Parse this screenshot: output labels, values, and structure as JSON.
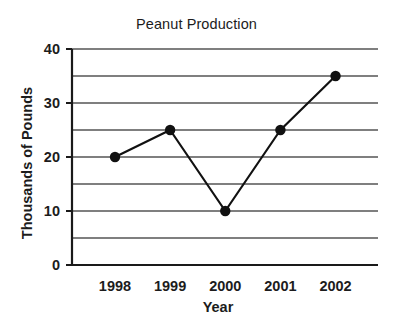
{
  "chart_data": {
    "type": "line",
    "title": "Peanut Production",
    "xlabel": "Year",
    "ylabel": "Thousands of Pounds",
    "categories": [
      "1998",
      "1999",
      "2000",
      "2001",
      "2002"
    ],
    "values": [
      20,
      25,
      10,
      25,
      35
    ],
    "series": [
      {
        "name": "Peanut Production",
        "values": [
          20,
          25,
          10,
          25,
          35
        ]
      }
    ],
    "ylim": [
      0,
      40
    ],
    "y_tick_labels": [
      "0",
      "10",
      "20",
      "30",
      "40"
    ],
    "y_tick_values": [
      0,
      10,
      20,
      30,
      40
    ],
    "gridline_values": [
      5,
      10,
      15,
      20,
      25,
      30,
      35,
      40
    ],
    "grid": true,
    "grid_orientation": "horizontal",
    "legend": "none",
    "marker": "filled-circle",
    "line_color": "#111111",
    "marker_color": "#111111",
    "grid_color": "#555555",
    "axis_color": "#1a1a1a",
    "background_color": "#ffffff"
  }
}
